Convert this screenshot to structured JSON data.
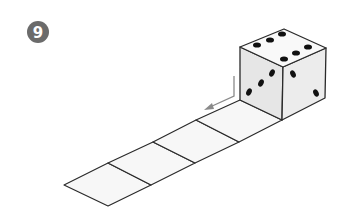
{
  "figure": {
    "problem_number": "9",
    "die": {
      "top_face_pips": 6,
      "left_face_pips": 3,
      "right_face_pips": 2
    },
    "strip": {
      "square_count": 5,
      "squares_free_of_die": 4
    },
    "arrow": {
      "direction": "down-left along strip"
    }
  },
  "colors": {
    "badge": "#6b6b6b",
    "badge_text": "#ffffff",
    "outline": "#2a2a2a",
    "strip_fill": "#f7f7f7",
    "top_face": "#f9f9f9",
    "left_face": "#e6e6e6",
    "right_face": "#ececec",
    "pip": "#111111",
    "arrow": "#8a8a8a"
  }
}
